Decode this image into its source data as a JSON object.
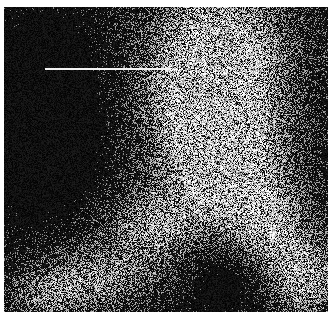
{
  "figure": {
    "type": "grayscale-micrograph",
    "frame": {
      "x": 4,
      "y": 7,
      "width": 324,
      "height": 305
    },
    "background_color": "#050505",
    "noise_seed": 1337,
    "bright_regions": [
      {
        "cx": 215,
        "cy": 40,
        "rx": 70,
        "ry": 70,
        "intensity": 0.95
      },
      {
        "cx": 205,
        "cy": 110,
        "rx": 65,
        "ry": 60,
        "intensity": 0.85
      },
      {
        "cx": 225,
        "cy": 170,
        "rx": 60,
        "ry": 50,
        "intensity": 0.8
      },
      {
        "cx": 265,
        "cy": 225,
        "rx": 45,
        "ry": 45,
        "intensity": 0.7
      },
      {
        "cx": 300,
        "cy": 275,
        "rx": 40,
        "ry": 40,
        "intensity": 0.75
      },
      {
        "cx": 150,
        "cy": 220,
        "rx": 50,
        "ry": 40,
        "intensity": 0.65
      },
      {
        "cx": 90,
        "cy": 270,
        "rx": 60,
        "ry": 35,
        "intensity": 0.6
      },
      {
        "cx": 40,
        "cy": 290,
        "rx": 40,
        "ry": 25,
        "intensity": 0.45
      }
    ],
    "dark_regions": [
      {
        "cx": 40,
        "cy": 110,
        "rx": 60,
        "ry": 90,
        "depth": 0.8
      },
      {
        "cx": 230,
        "cy": 270,
        "rx": 45,
        "ry": 35,
        "depth": 0.6
      }
    ],
    "arrow": {
      "x1": 41,
      "y1": 62,
      "x2": 168,
      "y2": 62,
      "color": "#f2f2f2",
      "stroke_width": 2,
      "direction": "right",
      "label": "arrow pointing to bright region"
    }
  }
}
